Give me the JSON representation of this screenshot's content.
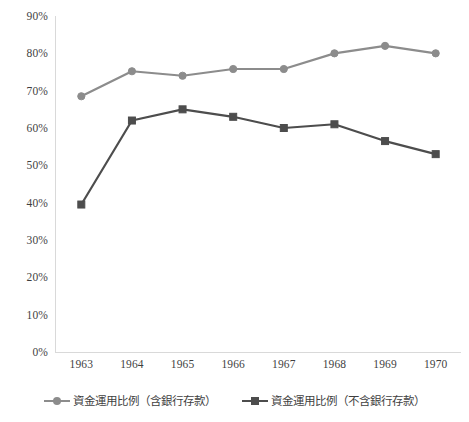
{
  "chart_data": {
    "type": "line",
    "title": "",
    "subtitle": "",
    "xlabel": "",
    "ylabel": "",
    "categories": [
      "1963",
      "1964",
      "1965",
      "1966",
      "1967",
      "1968",
      "1969",
      "1970"
    ],
    "ylim": [
      0,
      90
    ],
    "ytick_step": 10,
    "ytick_labels": [
      "90%",
      "80%",
      "70%",
      "60%",
      "50%",
      "40%",
      "30%",
      "20%",
      "10%",
      "0%"
    ],
    "ytick_values": [
      90,
      80,
      70,
      60,
      50,
      40,
      30,
      20,
      10,
      0
    ],
    "value_suffix": "%",
    "grid": false,
    "legend_position": "bottom",
    "series": [
      {
        "name": "資金運用比例（含銀行存款）",
        "marker": "circle",
        "color": "#8c8c8c",
        "values": [
          68.5,
          75.2,
          74.0,
          75.8,
          75.8,
          80.0,
          82.0,
          80.0
        ]
      },
      {
        "name": "資金運用比例（不含銀行存款）",
        "marker": "square",
        "color": "#4d4d4d",
        "values": [
          39.5,
          62.0,
          65.0,
          63.0,
          60.0,
          61.0,
          56.5,
          53.0
        ]
      }
    ]
  },
  "axes": {
    "y_ticks": [
      {
        "label": "90%",
        "value": 90
      },
      {
        "label": "80%",
        "value": 80
      },
      {
        "label": "70%",
        "value": 70
      },
      {
        "label": "60%",
        "value": 60
      },
      {
        "label": "50%",
        "value": 50
      },
      {
        "label": "40%",
        "value": 40
      },
      {
        "label": "30%",
        "value": 30
      },
      {
        "label": "20%",
        "value": 20
      },
      {
        "label": "10%",
        "value": 10
      },
      {
        "label": "0%",
        "value": 0
      }
    ],
    "x_ticks": [
      {
        "label": "1963"
      },
      {
        "label": "1964"
      },
      {
        "label": "1965"
      },
      {
        "label": "1966"
      },
      {
        "label": "1967"
      },
      {
        "label": "1968"
      },
      {
        "label": "1969"
      },
      {
        "label": "1970"
      }
    ],
    "axis_line_color": "#d9d9d9"
  },
  "legend": {
    "items": [
      {
        "label": "資金運用比例（含銀行存款）",
        "color": "#8c8c8c",
        "marker": "circle-marker"
      },
      {
        "label": "資金運用比例（不含銀行存款）",
        "color": "#4d4d4d",
        "marker": "square-marker"
      }
    ]
  }
}
